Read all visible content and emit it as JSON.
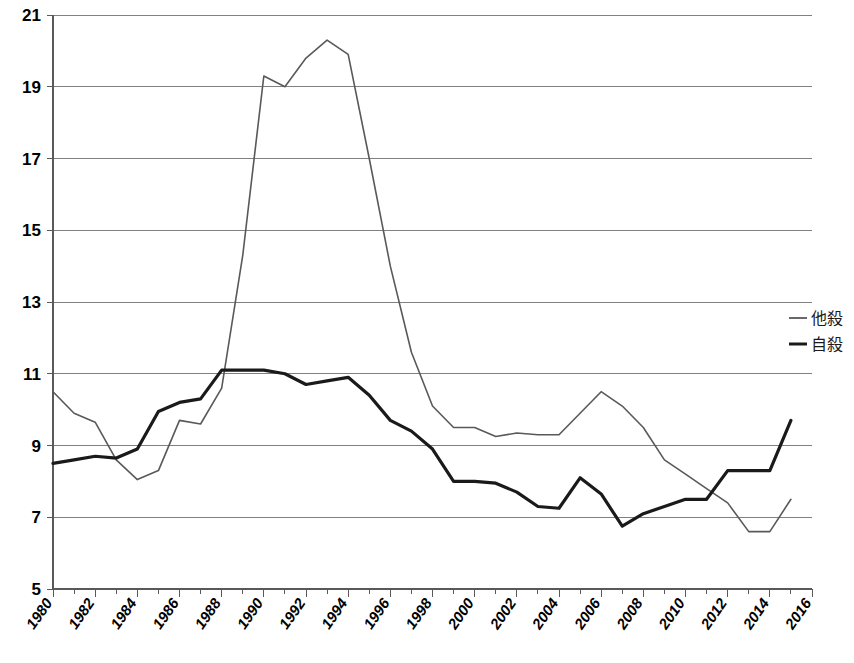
{
  "chart_data": {
    "type": "line",
    "title": "",
    "xlabel": "",
    "ylabel": "",
    "xlim": [
      1980,
      2016
    ],
    "ylim": [
      5,
      21
    ],
    "grid": true,
    "legend_position": "right",
    "x": [
      1980,
      1981,
      1982,
      1983,
      1984,
      1985,
      1986,
      1987,
      1988,
      1989,
      1990,
      1991,
      1992,
      1993,
      1994,
      1995,
      1996,
      1997,
      1998,
      1999,
      2000,
      2001,
      2002,
      2003,
      2004,
      2005,
      2006,
      2007,
      2008,
      2009,
      2010,
      2011,
      2012,
      2013,
      2014,
      2015
    ],
    "x_tick_labels": [
      "1980",
      "1982",
      "1984",
      "1986",
      "1988",
      "1990",
      "1992",
      "1994",
      "1996",
      "1998",
      "2000",
      "2002",
      "2004",
      "2006",
      "2008",
      "2010",
      "2012",
      "2014",
      "2016"
    ],
    "y_tick_labels": [
      "21",
      "19",
      "17",
      "15",
      "13",
      "11",
      "9",
      "7",
      "5"
    ],
    "y_ticks": [
      21,
      19,
      17,
      15,
      13,
      11,
      9,
      7,
      5
    ],
    "series": [
      {
        "name": "他殺",
        "color": "#595959",
        "width": 1.6,
        "values": [
          10.5,
          9.9,
          9.65,
          8.6,
          8.05,
          8.3,
          9.7,
          9.6,
          10.6,
          14.3,
          19.3,
          19.0,
          19.8,
          20.3,
          19.9,
          17.0,
          14.0,
          11.6,
          10.1,
          9.5,
          9.5,
          9.25,
          9.35,
          9.3,
          9.3,
          9.9,
          10.5,
          10.1,
          9.5,
          8.6,
          8.2,
          7.8,
          7.4,
          6.6,
          6.6,
          7.5
        ]
      },
      {
        "name": "自殺",
        "color": "#1a1a1a",
        "width": 3.2,
        "values": [
          8.5,
          8.6,
          8.7,
          8.65,
          8.9,
          9.95,
          10.2,
          10.3,
          11.1,
          11.1,
          11.1,
          11.0,
          10.7,
          10.8,
          10.9,
          10.4,
          9.7,
          9.4,
          8.9,
          8.0,
          8.0,
          7.95,
          7.7,
          7.3,
          7.25,
          8.1,
          7.65,
          6.75,
          7.1,
          7.3,
          7.5,
          7.5,
          8.3,
          8.3,
          8.3,
          9.7
        ]
      }
    ],
    "legend_entries": [
      {
        "label": "他殺",
        "color": "#595959",
        "width": 1.8
      },
      {
        "label": "自殺",
        "color": "#1a1a1a",
        "width": 3.0
      }
    ]
  }
}
